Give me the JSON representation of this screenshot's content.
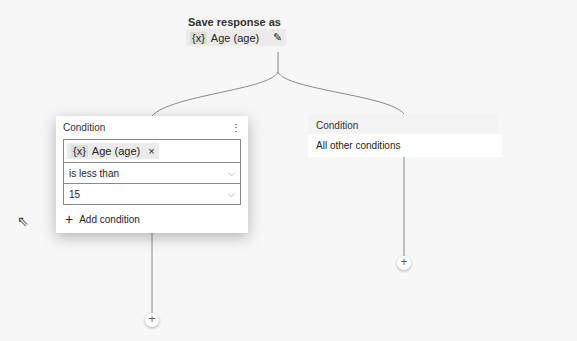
{
  "save_response": {
    "title": "Save response as",
    "var_icon": "{x}",
    "var_label": "Age (age)"
  },
  "condition_card": {
    "title": "Condition",
    "variable": {
      "icon": "{x}",
      "label": "Age (age)"
    },
    "operator": "is less than",
    "value": "15",
    "add_condition": "Add condition"
  },
  "other_card": {
    "title": "Condition",
    "body": "All other conditions"
  },
  "icons": {
    "more": "⋮",
    "close": "×",
    "chevron": "⌵",
    "plus": "+",
    "edit": "✎",
    "cursor": "⇖"
  }
}
